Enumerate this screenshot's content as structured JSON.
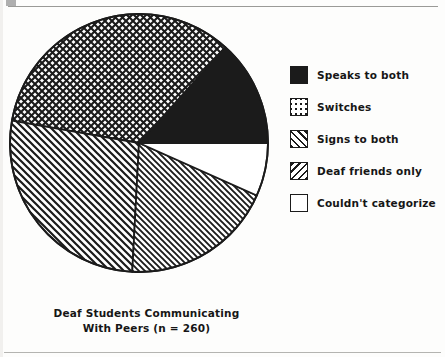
{
  "figure": {
    "caption_line1": "Deaf Students Communicating",
    "caption_line2": "With Peers (n = 260)"
  },
  "legend": {
    "items": [
      {
        "label": "Speaks to both",
        "pattern": "solid-black",
        "swatch_name": "legend-swatch-speaks-to-both"
      },
      {
        "label": "Switches",
        "pattern": "crosshatch",
        "swatch_name": "legend-swatch-switches"
      },
      {
        "label": "Signs to both",
        "pattern": "hatch-forward",
        "swatch_name": "legend-swatch-signs-to-both"
      },
      {
        "label": "Deaf friends only",
        "pattern": "hatch-back",
        "swatch_name": "legend-swatch-deaf-friends-only"
      },
      {
        "label": "Couldn't categorize",
        "pattern": "white",
        "swatch_name": "legend-swatch-couldnt-categorize"
      }
    ]
  },
  "chart_data": {
    "type": "pie",
    "title": "Deaf Students Communicating With Peers (n = 260)",
    "xlabel": "",
    "ylabel": "",
    "n": 260,
    "units": "percent of students",
    "grid": false,
    "legend_position": "right",
    "start_angle_deg": 0,
    "direction": "counterclockwise",
    "categories": [
      "Speaks to both",
      "Switches",
      "Signs to both",
      "Deaf friends only",
      "Couldn't categorize"
    ],
    "values": [
      13.3,
      33.9,
      27.0,
      19.0,
      6.8
    ],
    "angles_deg": [
      48,
      122,
      97,
      69,
      24
    ],
    "counts": [
      35,
      88,
      70,
      49,
      18
    ],
    "slices": [
      {
        "label": "Speaks to both",
        "percent": 13.3,
        "angle_deg": 48,
        "start_deg": 0,
        "end_deg": 48,
        "pattern": "solid-black",
        "count": 35
      },
      {
        "label": "Switches",
        "percent": 33.9,
        "angle_deg": 122,
        "start_deg": 48,
        "end_deg": 170,
        "pattern": "crosshatch",
        "count": 88
      },
      {
        "label": "Signs to both",
        "percent": 27.0,
        "angle_deg": 97,
        "start_deg": 170,
        "end_deg": 267,
        "pattern": "hatch-forward",
        "count": 70
      },
      {
        "label": "Deaf friends only",
        "percent": 19.0,
        "angle_deg": 69,
        "start_deg": 267,
        "end_deg": 336,
        "pattern": "hatch-back",
        "count": 49
      },
      {
        "label": "Couldn't categorize",
        "percent": 6.8,
        "angle_deg": 24,
        "start_deg": 336,
        "end_deg": 360,
        "pattern": "white",
        "count": 18
      }
    ],
    "colors": {
      "ink": "#1b1b1b",
      "paper": "#ffffff"
    }
  }
}
